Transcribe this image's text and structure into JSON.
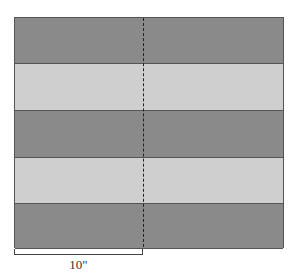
{
  "diagram": {
    "type": "striped-quilt-panel",
    "stripe_count": 5,
    "stripes": [
      {
        "shade": "dark",
        "color": "#8a8a8a"
      },
      {
        "shade": "light",
        "color": "#cfcfcf"
      },
      {
        "shade": "dark",
        "color": "#8a8a8a"
      },
      {
        "shade": "light",
        "color": "#cfcfcf"
      },
      {
        "shade": "dark",
        "color": "#8a8a8a"
      }
    ],
    "center_line": "dashed",
    "dimension": {
      "label": "10\"",
      "spans": "left half"
    }
  }
}
